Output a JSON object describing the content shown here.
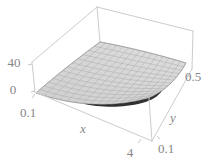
{
  "figure": {
    "kind": "3d-surface-plot",
    "background": "#ffffff"
  },
  "labels": {
    "z_tick_40": "40",
    "z_tick_0": "0",
    "x_tick_min": "0.1",
    "x_tick_max": "4",
    "x_axis": "x",
    "y_tick_min": "0.1",
    "y_tick_max": "0.5",
    "y_axis": "y"
  },
  "chart_data": {
    "type": "surface",
    "title": "",
    "x_axis": {
      "label": "x",
      "range": [
        0.1,
        4
      ],
      "ticks": [
        0.1,
        4
      ]
    },
    "y_axis": {
      "label": "y",
      "range": [
        0.1,
        0.5
      ],
      "ticks": [
        0.1,
        0.5
      ]
    },
    "z_axis": {
      "label": "",
      "range": [
        0,
        40
      ],
      "ticks": [
        0,
        40
      ]
    },
    "grid": false,
    "legend": "none",
    "surface": {
      "description": "Light-gray wire-mesh surface inside a perspective box; nearly zero at x=0.1, rising steeply toward the front corner (x=4, y=0.1) up to about z=38, and falling off rapidly as y grows; a thin dark underside strip is visible along the front edge.",
      "x_samples": [
        0.1,
        1,
        2,
        3,
        4
      ],
      "y_samples": [
        0.1,
        0.3,
        0.5
      ],
      "z_estimated": [
        [
          0,
          2,
          10,
          21,
          38
        ],
        [
          0,
          0.3,
          1.1,
          2.3,
          4.2
        ],
        [
          0,
          0.1,
          0.4,
          0.9,
          1.5
        ]
      ],
      "mesh_divisions": [
        15,
        13
      ]
    },
    "colors": {
      "surface_fill_light": "#dedede",
      "surface_fill_dark": "#cfcfcf",
      "mesh_line": "#ababab",
      "surface_edge": "#9a9a9a",
      "box_line": "#cccccc",
      "tick_mark": "#b8b8b8",
      "tick_text": "#868686",
      "dark_underside": "#1f1f1f"
    }
  }
}
